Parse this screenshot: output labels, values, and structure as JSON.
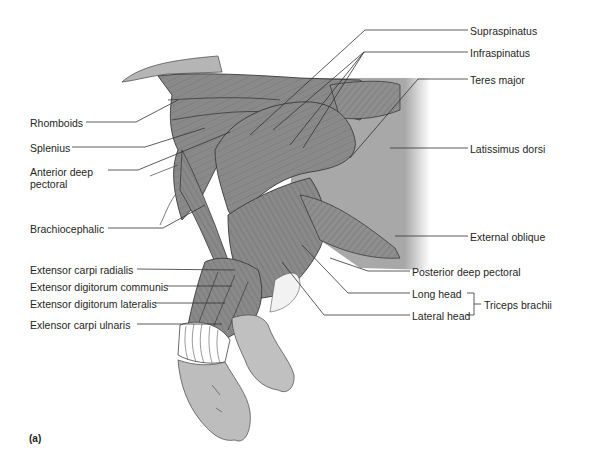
{
  "figure": {
    "panel_label": "(a)",
    "colors": {
      "muscle": "#8a8a8a",
      "muscle_dark": "#6f6f6f",
      "skin": "#b9b9b9",
      "background_tissue": "#a9a9a9",
      "outline": "#3a3a3a",
      "leader": "#333333",
      "text": "#262626"
    }
  },
  "labels_left": [
    {
      "id": "rhomboids",
      "text": "Rhomboids"
    },
    {
      "id": "splenius",
      "text": "Splenius"
    },
    {
      "id": "anterior-deep-pectoral",
      "text": "Anterior deep pectoral"
    },
    {
      "id": "brachiocephalic",
      "text": "Brachiocephalic"
    },
    {
      "id": "extensor-carpi-radialis",
      "text": "Extensor carpi radialis"
    },
    {
      "id": "extensor-digitorum-communis",
      "text": "Extensor digitorum communis"
    },
    {
      "id": "extensor-digitorum-lateralis",
      "text": "Extensor digitorum lateralis"
    },
    {
      "id": "extensor-carpi-ulnaris",
      "text": "Exlensor carpi ulnaris"
    }
  ],
  "labels_right": [
    {
      "id": "supraspinatus",
      "text": "Supraspinatus"
    },
    {
      "id": "infraspinatus",
      "text": "Infraspinatus"
    },
    {
      "id": "teres-major",
      "text": "Teres major"
    },
    {
      "id": "latissimus-dorsi",
      "text": "Latissimus dorsi"
    },
    {
      "id": "external-oblique",
      "text": "External oblique"
    },
    {
      "id": "posterior-deep-pectoral",
      "text": "Posterior deep pectoral"
    },
    {
      "id": "long-head",
      "text": "Long head"
    },
    {
      "id": "lateral-head",
      "text": "Lateral head"
    }
  ],
  "group_label": {
    "id": "triceps-brachii",
    "text": "Triceps brachii",
    "members": [
      "Long head",
      "Lateral head"
    ]
  }
}
